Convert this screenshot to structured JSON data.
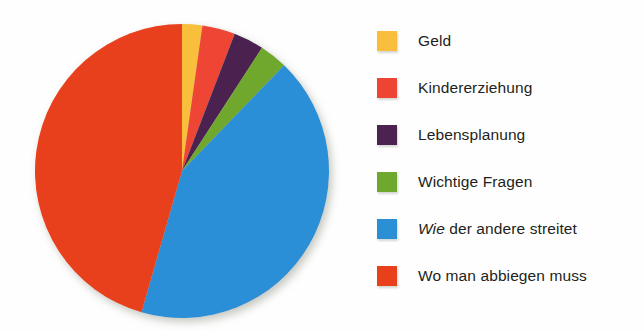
{
  "chart_data": {
    "type": "pie",
    "title": "",
    "subtitle": "",
    "xlabel": "",
    "ylabel": "",
    "grid": false,
    "legend_position": "right",
    "categories": [
      "Geld",
      "Kindererziehung",
      "Lebensplanung",
      "Wichtige Fragen",
      "Wie der andere streitet",
      "Wo man abbiegen muss"
    ],
    "values": [
      2.2,
      3.6,
      3.3,
      3.1,
      42.2,
      45.6
    ],
    "colors": [
      "#f9be3b",
      "#ee4434",
      "#4c2350",
      "#6fa82e",
      "#2b8fd6",
      "#e8401a"
    ],
    "units": "percent",
    "slices": [
      {
        "label": "Geld",
        "value": 2.2,
        "color": "#f9be3b",
        "start_deg": 0.0,
        "end_deg": 8.0
      },
      {
        "label": "Kindererziehung",
        "value": 3.6,
        "color": "#ee4434",
        "start_deg": 8.0,
        "end_deg": 21.0
      },
      {
        "label": "Lebensplanung",
        "value": 3.3,
        "color": "#4c2350",
        "start_deg": 21.0,
        "end_deg": 33.0
      },
      {
        "label": "Wichtige Fragen",
        "value": 3.1,
        "color": "#6fa82e",
        "start_deg": 33.0,
        "end_deg": 44.0
      },
      {
        "label": "Wie der andere streitet",
        "value": 42.2,
        "color": "#2b8fd6",
        "start_deg": 44.0,
        "end_deg": 196.0
      },
      {
        "label": "Wo man abbiegen muss",
        "value": 45.6,
        "color": "#e8401a",
        "start_deg": 196.0,
        "end_deg": 360.0
      }
    ],
    "geometry": {
      "cx": 182,
      "cy": 171,
      "r": 147
    }
  },
  "legend": {
    "items": [
      {
        "label": "Geld",
        "color": "#f9be3b",
        "italic_prefix": ""
      },
      {
        "label": "Kindererziehung",
        "color": "#ee4434",
        "italic_prefix": ""
      },
      {
        "label": "Lebensplanung",
        "color": "#4c2350",
        "italic_prefix": ""
      },
      {
        "label": "Wichtige Fragen",
        "color": "#6fa82e",
        "italic_prefix": ""
      },
      {
        "label": "der andere streitet",
        "color": "#2b8fd6",
        "italic_prefix": "Wie"
      },
      {
        "label": "Wo man abbiegen muss",
        "color": "#e8401a",
        "italic_prefix": ""
      }
    ]
  }
}
